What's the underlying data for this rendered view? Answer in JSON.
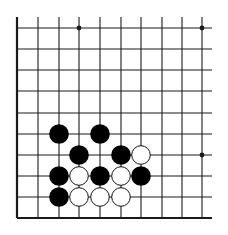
{
  "board": {
    "type": "go-board-fragment",
    "colors": {
      "background": "#ffffff",
      "line": "#1a1a1a",
      "black_stone": "#000000",
      "white_stone": "#ffffff",
      "white_outline": "#111111"
    },
    "columns": 10,
    "rows": 10,
    "edges": {
      "left": true,
      "bottom": true,
      "top": false,
      "right": false
    },
    "col_x": [
      17,
      38,
      59,
      79,
      100,
      121,
      141,
      162,
      182,
      202
    ],
    "row_y": [
      28,
      49,
      70,
      91,
      113,
      134,
      155,
      176,
      197,
      218
    ],
    "star_points": [
      {
        "col": 3,
        "row": 0
      },
      {
        "col": 9,
        "row": 0
      },
      {
        "col": 9,
        "row": 6
      }
    ],
    "stones": [
      {
        "color": "black",
        "col": 2,
        "row": 5
      },
      {
        "color": "black",
        "col": 4,
        "row": 5
      },
      {
        "color": "black",
        "col": 3,
        "row": 6
      },
      {
        "color": "black",
        "col": 5,
        "row": 6
      },
      {
        "color": "white",
        "col": 6,
        "row": 6
      },
      {
        "color": "black",
        "col": 2,
        "row": 7
      },
      {
        "color": "white",
        "col": 3,
        "row": 7
      },
      {
        "color": "black",
        "col": 4,
        "row": 7
      },
      {
        "color": "white",
        "col": 5,
        "row": 7
      },
      {
        "color": "black",
        "col": 6,
        "row": 7
      },
      {
        "color": "black",
        "col": 2,
        "row": 8
      },
      {
        "color": "white",
        "col": 3,
        "row": 8
      },
      {
        "color": "white",
        "col": 4,
        "row": 8
      },
      {
        "color": "white",
        "col": 5,
        "row": 8
      }
    ]
  }
}
